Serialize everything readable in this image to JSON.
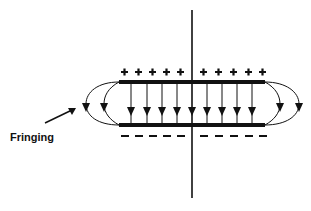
{
  "diagram": {
    "title": "",
    "type": "parallel-plate capacitor electric field with fringing",
    "labels": {
      "fringing": "Fringing"
    },
    "top_plate": {
      "charge_symbol": "+",
      "count": 10
    },
    "bottom_plate": {
      "charge_symbol": "−",
      "count": 10
    },
    "field_lines": {
      "interior_count": 9,
      "fringe_per_side": 2,
      "direction": "top-to-bottom"
    },
    "colors": {
      "ink": "#111111",
      "background": "#ffffff"
    }
  }
}
